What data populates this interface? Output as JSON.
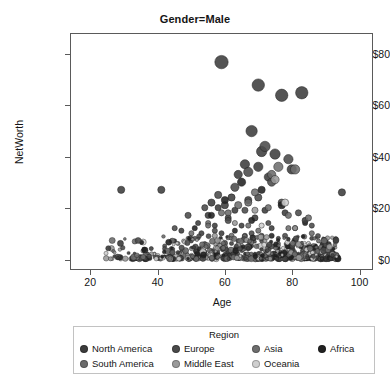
{
  "chart_data": {
    "type": "scatter",
    "title": "Gender=Male",
    "xlabel": "Age",
    "ylabel": "NetWorth",
    "xlim": [
      14,
      104
    ],
    "ylim": [
      -4,
      88
    ],
    "grid": false,
    "xticks": [
      "20",
      "40",
      "60",
      "80",
      "100"
    ],
    "xtick_values": [
      20,
      40,
      60,
      80,
      100
    ],
    "yticks": [
      "$0",
      "$20",
      "$40",
      "$60",
      "$80"
    ],
    "ytick_values": [
      0,
      20,
      40,
      60,
      80
    ],
    "legend": {
      "title": "Region",
      "position": "below-axes",
      "entries": [
        {
          "label": "North America",
          "color": "#3c3c3c"
        },
        {
          "label": "Europe",
          "color": "#4a4a4a"
        },
        {
          "label": "Asia",
          "color": "#6e6e6e"
        },
        {
          "label": "Africa",
          "color": "#212121"
        },
        {
          "label": "South America",
          "color": "#6b6b6b"
        },
        {
          "label": "Middle East",
          "color": "#9a9a9a"
        },
        {
          "label": "Oceania",
          "color": "#cfcfcf"
        }
      ]
    },
    "series": [
      {
        "name": "North America",
        "color": "#3c3c3c",
        "points": [
          [
            59,
            77,
            13
          ],
          [
            70,
            68,
            12
          ],
          [
            77,
            64,
            12
          ],
          [
            83,
            65,
            12
          ],
          [
            68,
            50,
            11
          ],
          [
            71,
            42,
            10
          ],
          [
            75,
            41,
            10
          ],
          [
            66,
            37,
            9
          ],
          [
            70,
            36,
            9
          ],
          [
            80,
            35,
            9
          ],
          [
            64,
            33,
            8
          ],
          [
            73,
            32,
            8
          ],
          [
            29,
            27,
            7
          ],
          [
            41,
            27,
            7
          ],
          [
            95,
            26,
            7
          ],
          [
            62,
            24,
            7
          ],
          [
            67,
            23,
            7
          ],
          [
            56,
            22,
            7
          ],
          [
            60,
            21,
            7
          ],
          [
            58,
            20,
            6
          ],
          [
            63,
            19,
            6
          ],
          [
            72,
            19,
            6
          ],
          [
            78,
            18,
            6
          ],
          [
            55,
            17,
            6
          ],
          [
            61,
            16,
            6
          ],
          [
            69,
            16,
            6
          ],
          [
            84,
            15,
            6
          ],
          [
            52,
            14,
            5
          ],
          [
            57,
            13,
            5
          ],
          [
            65,
            13,
            5
          ],
          [
            74,
            12,
            5
          ],
          [
            81,
            12,
            5
          ],
          [
            47,
            11,
            5
          ],
          [
            53,
            10,
            5
          ],
          [
            59,
            10,
            5
          ],
          [
            66,
            9,
            5
          ],
          [
            71,
            9,
            5
          ],
          [
            76,
            8,
            4
          ],
          [
            86,
            8,
            4
          ],
          [
            44,
            7,
            4
          ],
          [
            50,
            7,
            4
          ],
          [
            54,
            6,
            4
          ],
          [
            62,
            6,
            4
          ],
          [
            68,
            5,
            4
          ],
          [
            73,
            5,
            4
          ],
          [
            79,
            5,
            4
          ],
          [
            88,
            4,
            4
          ],
          [
            38,
            4,
            4
          ],
          [
            43,
            3,
            3
          ],
          [
            48,
            3,
            3
          ],
          [
            51,
            3,
            3
          ],
          [
            56,
            2,
            3
          ],
          [
            60,
            2,
            3
          ],
          [
            64,
            2,
            3
          ],
          [
            69,
            2,
            3
          ],
          [
            74,
            2,
            3
          ],
          [
            78,
            2,
            3
          ],
          [
            82,
            2,
            3
          ],
          [
            85,
            2,
            3
          ],
          [
            90,
            2,
            3
          ],
          [
            33,
            2,
            3
          ],
          [
            36,
            1,
            3
          ],
          [
            40,
            1,
            3
          ],
          [
            45,
            1,
            3
          ],
          [
            49,
            1,
            3
          ],
          [
            53,
            1,
            3
          ],
          [
            57,
            1,
            3
          ],
          [
            61,
            1,
            3
          ],
          [
            65,
            1,
            3
          ],
          [
            70,
            1,
            3
          ],
          [
            75,
            1,
            3
          ],
          [
            80,
            1,
            3
          ],
          [
            84,
            1,
            3
          ],
          [
            89,
            1,
            3
          ],
          [
            93,
            1,
            3
          ],
          [
            27,
            1,
            3
          ]
        ]
      },
      {
        "name": "Europe",
        "color": "#4a4a4a",
        "points": [
          [
            72,
            44,
            10
          ],
          [
            79,
            39,
            9
          ],
          [
            67,
            34,
            9
          ],
          [
            74,
            30,
            8
          ],
          [
            63,
            28,
            8
          ],
          [
            58,
            25,
            7
          ],
          [
            70,
            24,
            7
          ],
          [
            77,
            22,
            7
          ],
          [
            54,
            20,
            6
          ],
          [
            66,
            19,
            6
          ],
          [
            82,
            18,
            6
          ],
          [
            49,
            17,
            6
          ],
          [
            61,
            15,
            6
          ],
          [
            73,
            14,
            5
          ],
          [
            86,
            13,
            5
          ],
          [
            45,
            12,
            5
          ],
          [
            57,
            11,
            5
          ],
          [
            68,
            10,
            5
          ],
          [
            78,
            9,
            5
          ],
          [
            51,
            8,
            4
          ],
          [
            64,
            7,
            4
          ],
          [
            71,
            7,
            4
          ],
          [
            83,
            6,
            4
          ],
          [
            42,
            5,
            4
          ],
          [
            55,
            5,
            4
          ],
          [
            60,
            4,
            4
          ],
          [
            76,
            4,
            4
          ],
          [
            87,
            3,
            3
          ],
          [
            47,
            3,
            3
          ],
          [
            52,
            2,
            3
          ],
          [
            58,
            2,
            3
          ],
          [
            67,
            2,
            3
          ],
          [
            72,
            2,
            3
          ],
          [
            81,
            2,
            3
          ],
          [
            91,
            2,
            3
          ],
          [
            37,
            2,
            3
          ],
          [
            43,
            1,
            3
          ],
          [
            50,
            1,
            3
          ],
          [
            56,
            1,
            3
          ],
          [
            62,
            1,
            3
          ],
          [
            69,
            1,
            3
          ],
          [
            77,
            1,
            3
          ],
          [
            85,
            1,
            3
          ],
          [
            92,
            1,
            3
          ]
        ]
      },
      {
        "name": "Asia",
        "color": "#6e6e6e",
        "points": [
          [
            76,
            36,
            9
          ],
          [
            81,
            35,
            9
          ],
          [
            69,
            26,
            7
          ],
          [
            64,
            21,
            7
          ],
          [
            73,
            20,
            6
          ],
          [
            59,
            18,
            6
          ],
          [
            85,
            16,
            6
          ],
          [
            55,
            14,
            5
          ],
          [
            67,
            13,
            5
          ],
          [
            79,
            12,
            5
          ],
          [
            50,
            10,
            5
          ],
          [
            62,
            9,
            5
          ],
          [
            71,
            8,
            4
          ],
          [
            88,
            7,
            4
          ],
          [
            46,
            6,
            4
          ],
          [
            58,
            5,
            4
          ],
          [
            75,
            5,
            4
          ],
          [
            66,
            4,
            4
          ],
          [
            53,
            3,
            3
          ],
          [
            83,
            3,
            3
          ],
          [
            48,
            2,
            3
          ],
          [
            61,
            2,
            3
          ],
          [
            70,
            2,
            3
          ],
          [
            90,
            2,
            3
          ],
          [
            40,
            1,
            3
          ],
          [
            57,
            1,
            3
          ],
          [
            64,
            1,
            3
          ],
          [
            74,
            1,
            3
          ],
          [
            80,
            1,
            3
          ],
          [
            87,
            1,
            3
          ]
        ]
      },
      {
        "name": "Africa",
        "color": "#212121",
        "points": [
          [
            65,
            30,
            8
          ],
          [
            71,
            27,
            7
          ],
          [
            60,
            23,
            7
          ],
          [
            77,
            21,
            7
          ],
          [
            56,
            17,
            6
          ],
          [
            68,
            15,
            6
          ],
          [
            84,
            14,
            5
          ],
          [
            51,
            12,
            5
          ],
          [
            63,
            11,
            5
          ],
          [
            74,
            9,
            5
          ],
          [
            45,
            7,
            4
          ],
          [
            58,
            6,
            4
          ],
          [
            70,
            5,
            4
          ],
          [
            80,
            4,
            4
          ],
          [
            48,
            3,
            3
          ],
          [
            54,
            2,
            3
          ],
          [
            66,
            2,
            3
          ],
          [
            76,
            2,
            3
          ],
          [
            89,
            2,
            3
          ],
          [
            35,
            1,
            3
          ],
          [
            42,
            1,
            3
          ],
          [
            52,
            1,
            3
          ],
          [
            61,
            1,
            3
          ],
          [
            72,
            1,
            3
          ],
          [
            82,
            1,
            3
          ],
          [
            94,
            1,
            3
          ]
        ]
      },
      {
        "name": "South America",
        "color": "#6b6b6b",
        "points": [
          [
            74,
            33,
            8
          ],
          [
            67,
            22,
            7
          ],
          [
            61,
            18,
            6
          ],
          [
            79,
            17,
            6
          ],
          [
            55,
            13,
            5
          ],
          [
            70,
            11,
            5
          ],
          [
            86,
            10,
            5
          ],
          [
            49,
            8,
            4
          ],
          [
            64,
            7,
            4
          ],
          [
            76,
            6,
            4
          ],
          [
            44,
            4,
            4
          ],
          [
            58,
            3,
            3
          ],
          [
            72,
            3,
            3
          ],
          [
            83,
            2,
            3
          ],
          [
            39,
            2,
            3
          ],
          [
            53,
            1,
            3
          ],
          [
            66,
            1,
            3
          ],
          [
            78,
            1,
            3
          ],
          [
            91,
            1,
            3
          ]
        ]
      },
      {
        "name": "Middle East",
        "color": "#9a9a9a",
        "points": [
          [
            75,
            31,
            8
          ],
          [
            69,
            19,
            6
          ],
          [
            63,
            14,
            5
          ],
          [
            81,
            12,
            5
          ],
          [
            57,
            9,
            5
          ],
          [
            72,
            7,
            4
          ],
          [
            87,
            5,
            4
          ],
          [
            50,
            4,
            4
          ],
          [
            65,
            3,
            3
          ],
          [
            77,
            2,
            3
          ],
          [
            46,
            2,
            3
          ],
          [
            59,
            1,
            3
          ],
          [
            70,
            1,
            3
          ],
          [
            84,
            1,
            3
          ]
        ]
      },
      {
        "name": "Oceania",
        "color": "#cfcfcf",
        "points": [
          [
            78,
            22,
            7
          ],
          [
            71,
            13,
            5
          ],
          [
            62,
            8,
            4
          ],
          [
            85,
            6,
            4
          ],
          [
            54,
            3,
            3
          ],
          [
            68,
            2,
            3
          ],
          [
            80,
            1,
            3
          ],
          [
            47,
            1,
            3
          ]
        ]
      }
    ]
  }
}
